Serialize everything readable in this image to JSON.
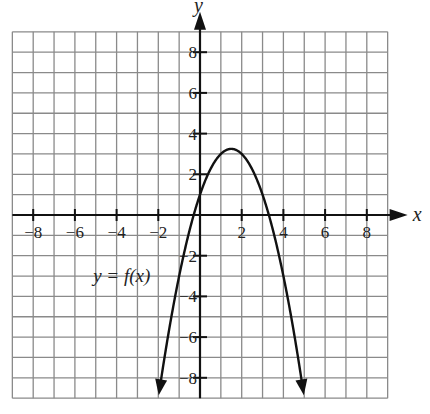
{
  "chart_data": {
    "type": "line",
    "title": "",
    "xlabel": "x",
    "ylabel": "y",
    "xlim": [
      -9,
      9
    ],
    "ylim": [
      -9,
      9
    ],
    "grid": true,
    "grid_step": 1,
    "x_ticks": [
      -8,
      -6,
      -4,
      -2,
      2,
      4,
      6,
      8
    ],
    "y_ticks": [
      -8,
      -6,
      -4,
      -2,
      2,
      4,
      6,
      8
    ],
    "x_tick_labels": [
      "−8",
      "−6",
      "−4",
      "−2",
      "2",
      "4",
      "6",
      "8"
    ],
    "y_tick_labels": [
      "−8",
      "−6",
      "−4",
      "−2",
      "2",
      "4",
      "6",
      "8"
    ],
    "annotations": [
      {
        "text": "y = f(x)",
        "x": -3.3,
        "y": -3.0
      }
    ],
    "series": [
      {
        "name": "y = f(x)",
        "shape": "downward parabola with arrows at both ends",
        "vertex": [
          1.5,
          3.25
        ],
        "y_intercept": 1,
        "x_intercepts": [
          -0.3,
          3.3
        ],
        "x_range": [
          -2,
          5
        ],
        "x": [
          -2,
          -1.5,
          -1,
          -0.5,
          0,
          0.5,
          1,
          1.5,
          2,
          2.5,
          3,
          3.5,
          4,
          4.5,
          5
        ],
        "values": [
          -9,
          -5.75,
          -3,
          -0.75,
          1,
          2.25,
          3,
          3.25,
          3,
          2.25,
          1,
          -0.75,
          -3,
          -5.75,
          -9
        ]
      }
    ]
  },
  "labels": {
    "x_axis": "x",
    "y_axis": "y",
    "curve": "y = f(x)"
  }
}
